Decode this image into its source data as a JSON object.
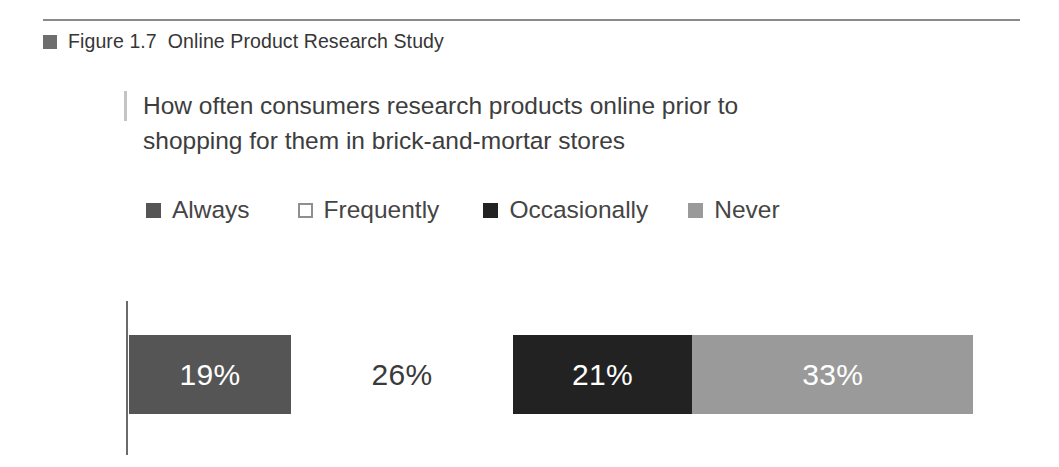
{
  "figure": {
    "bullet_icon": "filled-square-icon",
    "label": "Figure 1.7",
    "title": "Online Product Research Study",
    "heading": "Figure 1.7  Online Product Research Study"
  },
  "subtitle": {
    "line1": "How often consumers research products online prior to",
    "line2": "shopping for them in brick-and-mortar stores"
  },
  "legend": {
    "items": [
      {
        "label": "Always",
        "color": "#555555",
        "swatch": "filled-square-icon",
        "text_color": "#ffffff"
      },
      {
        "label": "Frequently",
        "color": "#ffffff",
        "swatch": "outlined-square-icon",
        "text_color": "#3a3a3a"
      },
      {
        "label": "Occasionally",
        "color": "#222222",
        "swatch": "filled-square-icon",
        "text_color": "#ffffff"
      },
      {
        "label": "Never",
        "color": "#9a9a9a",
        "swatch": "filled-square-icon",
        "text_color": "#ffffff"
      }
    ]
  },
  "colors": {
    "rule": "#8a8a8a",
    "axis": "#6b6b6b",
    "tick": "#c4c4c4",
    "text": "#3a3a3a",
    "background": "#ffffff"
  },
  "chart_data": {
    "type": "bar",
    "orientation": "horizontal-stacked",
    "title": "Online Product Research Study",
    "subtitle": "How often consumers research products online prior to shopping for them in brick-and-mortar stores",
    "xlabel": "",
    "ylabel": "",
    "categories": [
      "Always",
      "Frequently",
      "Occasionally",
      "Never"
    ],
    "values": [
      19,
      26,
      21,
      33
    ],
    "value_labels": [
      "19%",
      "26%",
      "21%",
      "33%"
    ],
    "units": "percent",
    "total": 99,
    "grid": false,
    "legend_position": "top",
    "series": [
      {
        "name": "How often consumers research products online",
        "values": [
          19,
          26,
          21,
          33
        ],
        "colors": [
          "#555555",
          "#ffffff",
          "#222222",
          "#9a9a9a"
        ],
        "label_colors": [
          "#ffffff",
          "#3a3a3a",
          "#ffffff",
          "#ffffff"
        ]
      }
    ]
  }
}
